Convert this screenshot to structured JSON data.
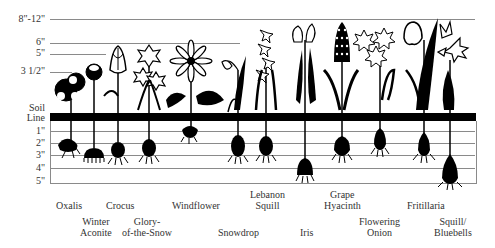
{
  "figure": {
    "above_ground_heights": [
      {
        "label": "8\"-12\"",
        "y": 19,
        "line_end": 475
      },
      {
        "label": "6\"",
        "y": 43,
        "line_end": 240
      },
      {
        "label": "5\"",
        "y": 54,
        "line_end": 106
      },
      {
        "label": "3 1/2\"",
        "y": 72,
        "line_end": 72
      }
    ],
    "soil_line_label_1": "Soil",
    "soil_line_label_2": "Line",
    "depths": [
      {
        "label": "1\"",
        "y": 131
      },
      {
        "label": "2\"",
        "y": 143
      },
      {
        "label": "3\"",
        "y": 155
      },
      {
        "label": "4\"",
        "y": 168
      },
      {
        "label": "5\"",
        "y": 181
      }
    ],
    "plants": [
      {
        "name": "Oxalis",
        "label_lines": [
          "Oxalis"
        ],
        "x": 73,
        "bulb_depth": "2\"-3\"",
        "row": 1
      },
      {
        "name": "Winter Aconite",
        "label_lines": [
          "Winter",
          "Aconite"
        ],
        "x": 94,
        "bulb_depth": "3\"",
        "row": 2
      },
      {
        "name": "Crocus",
        "label_lines": [
          "Crocus"
        ],
        "x": 118,
        "bulb_depth": "3\"",
        "row": 1
      },
      {
        "name": "Glory-of-the-Snow",
        "label_lines": [
          "Glory-",
          "of-the-Snow"
        ],
        "x": 149,
        "bulb_depth": "3\"",
        "row": 2
      },
      {
        "name": "Windflower",
        "label_lines": [
          "Windflower"
        ],
        "x": 191,
        "bulb_depth": "2\"",
        "row": 1
      },
      {
        "name": "Snowdrop",
        "label_lines": [
          "Snowdrop"
        ],
        "x": 238,
        "bulb_depth": "3\"",
        "row": 2
      },
      {
        "name": "Lebanon Squill",
        "label_lines": [
          "Lebanon",
          "Squill"
        ],
        "x": 266,
        "bulb_depth": "3\"",
        "row": 1
      },
      {
        "name": "Iris",
        "label_lines": [
          "Iris"
        ],
        "x": 305,
        "bulb_depth": "4\"-5\"",
        "row": 2
      },
      {
        "name": "Grape Hyacinth",
        "label_lines": [
          "Grape",
          "Hyacinth"
        ],
        "x": 342,
        "bulb_depth": "3\"",
        "row": 1
      },
      {
        "name": "Flowering Onion",
        "label_lines": [
          "Flowering",
          "Onion"
        ],
        "x": 380,
        "bulb_depth": "3\"",
        "row": 2
      },
      {
        "name": "Fritillaria",
        "label_lines": [
          "Fritillaria"
        ],
        "x": 424,
        "bulb_depth": "3\"-4\"",
        "row": 1
      },
      {
        "name": "Squill/Bluebells",
        "label_lines": [
          "Squill/",
          "Bluebells"
        ],
        "x": 450,
        "bulb_depth": "4\"-5\"",
        "row": 2
      }
    ]
  }
}
